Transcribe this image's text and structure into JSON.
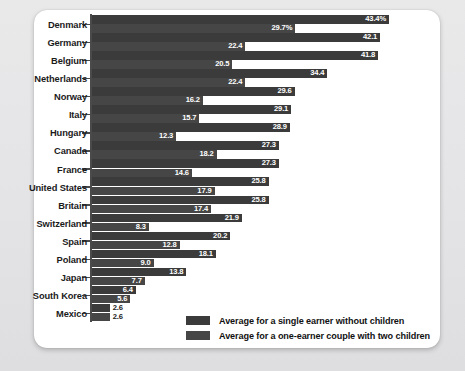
{
  "chart_data": {
    "type": "bar",
    "orientation": "horizontal",
    "title": "",
    "subtitle": "",
    "xlabel": "",
    "ylabel": "",
    "xlim": [
      0,
      43.4
    ],
    "grid": false,
    "legend_position": "bottom-right",
    "categories": [
      "Denmark",
      "Germany",
      "Belgium",
      "Netherlands",
      "Norway",
      "Italy",
      "Hungary",
      "Canada",
      "France",
      "United States",
      "Britain",
      "Switzerland",
      "Spain",
      "Poland",
      "Japan",
      "South Korea",
      "Mexico"
    ],
    "series": [
      {
        "name": "Average for a single earner without children",
        "color": "#3b3b3b",
        "values": [
          43.4,
          42.1,
          41.8,
          34.4,
          29.6,
          29.1,
          28.9,
          27.3,
          27.3,
          25.8,
          25.8,
          21.9,
          20.2,
          18.1,
          13.8,
          6.4,
          2.6
        ],
        "labels": [
          "43.4%",
          "42.1",
          "41.8",
          "34.4",
          "29.6",
          "29.1",
          "28.9",
          "27.3",
          "27.3",
          "25.8",
          "25.8",
          "21.9",
          "20.2",
          "18.1",
          "13.8",
          "6.4",
          "2.6"
        ]
      },
      {
        "name": "Average for a one-earner couple with two children",
        "color": "#464646",
        "values": [
          29.7,
          22.4,
          20.5,
          22.4,
          16.2,
          15.7,
          12.3,
          18.2,
          14.6,
          17.9,
          17.4,
          8.3,
          12.8,
          9.0,
          7.7,
          5.6,
          2.6
        ],
        "labels": [
          "29.7%",
          "22.4",
          "20.5",
          "22.4",
          "16.2",
          "15.7",
          "12.3",
          "18.2",
          "14.6",
          "17.9",
          "17.4",
          "8.3",
          "12.8",
          "9.0",
          "7.7",
          "5.6",
          "2.6"
        ]
      }
    ]
  },
  "legend": {
    "items": [
      {
        "label": "Average for a single earner without children"
      },
      {
        "label": "Average for a one-earner couple with two children"
      }
    ]
  }
}
